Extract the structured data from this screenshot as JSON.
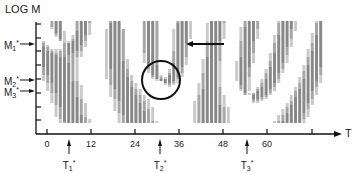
{
  "figure": {
    "y_axis_title": "LOG M",
    "x_axis_title": "T",
    "x_ticks": [
      {
        "label": "0",
        "x": 47
      },
      {
        "label": "12",
        "x": 91
      },
      {
        "label": "24",
        "x": 135
      },
      {
        "label": "36",
        "x": 179
      },
      {
        "label": "48",
        "x": 223
      },
      {
        "label": "60",
        "x": 267
      },
      {
        "label": "",
        "x": 312
      }
    ],
    "m_markers": [
      {
        "base": "M",
        "sub": "1",
        "sup": "*",
        "y": 44
      },
      {
        "base": "M",
        "sub": "2",
        "sup": "*",
        "y": 80
      },
      {
        "base": "M",
        "sub": "3",
        "sup": "*",
        "y": 91
      }
    ],
    "t_markers": [
      {
        "base": "T",
        "sub": "1",
        "sup": "*",
        "x": 69
      },
      {
        "base": "T",
        "sub": "2",
        "sup": "*",
        "x": 160
      },
      {
        "base": "T",
        "sub": "3",
        "sup": "*",
        "x": 247
      }
    ],
    "singularities": [
      {
        "name": "pinwheel-1",
        "x": 63,
        "y": 43
      },
      {
        "name": "pinwheel-2",
        "x": 161,
        "y": 80
      },
      {
        "name": "pinwheel-3",
        "x": 248,
        "y": 95
      }
    ],
    "circle": {
      "cx": 161,
      "cy": 80,
      "r": 19
    },
    "arrow": {
      "x1": 224,
      "y1": 44,
      "x2": 186,
      "y2": 44
    },
    "colors": {
      "ink": "#111111",
      "hatch_dark": "#222222",
      "hatch_light": "#9a9a9a",
      "background": "#ffffff"
    }
  }
}
